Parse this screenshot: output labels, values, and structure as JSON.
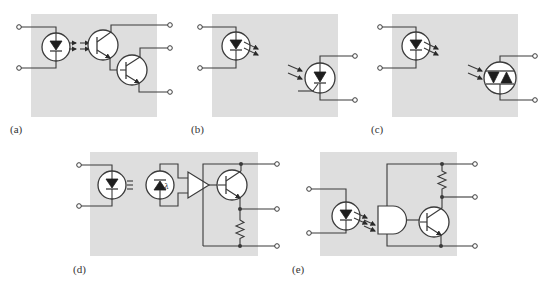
{
  "figure": {
    "panels": [
      {
        "id": "a",
        "label": "(a)",
        "description": "LED coupled to Darlington phototransistor pair",
        "emitter": "led",
        "detector": "darlington-phototransistor",
        "terminals": {
          "input": 2,
          "output": 3
        }
      },
      {
        "id": "b",
        "label": "(b)",
        "description": "LED coupled to photo-SCR",
        "emitter": "led",
        "detector": "photo-scr",
        "terminals": {
          "input": 2,
          "output": 2
        }
      },
      {
        "id": "c",
        "label": "(c)",
        "description": "LED coupled to photo-triac",
        "emitter": "led",
        "detector": "photo-triac",
        "terminals": {
          "input": 2,
          "output": 2
        }
      },
      {
        "id": "d",
        "label": "(d)",
        "description": "LED coupled to photodiode, amplifier and output transistor with emitter resistor",
        "emitter": "led",
        "detector": "photodiode-amplifier-transistor",
        "photodiode_symbol": "λ",
        "terminals": {
          "input": 2,
          "output": 3
        }
      },
      {
        "id": "e",
        "label": "(e)",
        "description": "LED coupled to logic gate driving transistor with pull-up resistor",
        "emitter": "led",
        "detector": "logic-gate-transistor",
        "terminals": {
          "input": 2,
          "output": 3
        }
      }
    ],
    "colors": {
      "panel_background": "#dedede",
      "line": "#3a3a3a",
      "page_background": "#ffffff"
    }
  }
}
